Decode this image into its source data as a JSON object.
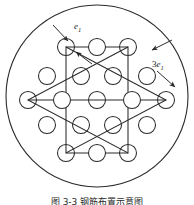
{
  "figure": {
    "type": "diagram",
    "caption": "图 3-3 钢筋布置示意图",
    "stroke_color": "#2b2b2b",
    "background_color": "#ffffff",
    "boundary": {
      "name": "outer-circle",
      "cx": 97,
      "cy": 96,
      "r": 91
    },
    "labels": [
      {
        "id": "e1",
        "coefficient": "",
        "symbol": "e",
        "subscript": "1",
        "text": "e1",
        "x": 74,
        "y": 22
      },
      {
        "id": "3e1",
        "coefficient": "3",
        "symbol": "e",
        "subscript": "1",
        "text": "3e1",
        "x": 152,
        "y": 60
      }
    ],
    "hexagram": {
      "triangle_up": [
        [
          66,
          47
        ],
        [
          166,
          100
        ],
        [
          66,
          153
        ]
      ],
      "triangle_down": [
        [
          128,
          47
        ],
        [
          28,
          100
        ],
        [
          128,
          153
        ]
      ],
      "note": "two overlapping triangles forming a star of david"
    },
    "rows": [
      {
        "name": "row-1-top",
        "y": 47,
        "count": 3,
        "x": [
          66,
          97,
          128
        ]
      },
      {
        "name": "row-2",
        "y": 76,
        "count": 4,
        "x": [
          47,
          81,
          113,
          147
        ]
      },
      {
        "name": "row-3-middle",
        "y": 100,
        "count": 5,
        "x": [
          28,
          62,
          97,
          132,
          166
        ]
      },
      {
        "name": "row-4",
        "y": 125,
        "count": 4,
        "x": [
          47,
          81,
          113,
          147
        ]
      },
      {
        "name": "row-5-bottom",
        "y": 153,
        "count": 3,
        "x": [
          66,
          97,
          128
        ]
      }
    ],
    "circle_radius": 8.5,
    "total_circles": 19,
    "arrows": [
      {
        "name": "arrow-e1-upper-left",
        "from": [
          55,
          27
        ],
        "to": [
          67,
          41
        ]
      },
      {
        "name": "arrow-e1-lower-right",
        "from": [
          90,
          62
        ],
        "to": [
          75,
          51
        ]
      },
      {
        "name": "arrow-3e1-upper",
        "from": [
          170,
          40
        ],
        "to": [
          152,
          50
        ]
      },
      {
        "name": "arrow-3e1-lower",
        "from": [
          158,
          72
        ],
        "to": [
          173,
          86
        ]
      }
    ]
  }
}
